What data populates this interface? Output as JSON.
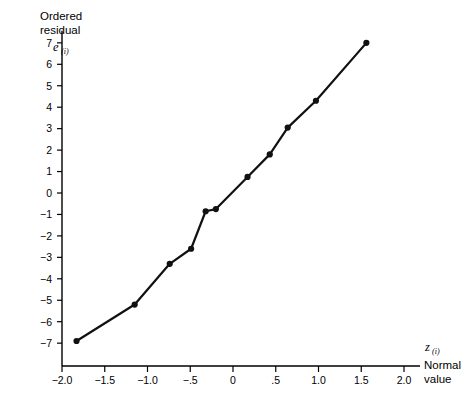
{
  "chart_data": {
    "type": "line",
    "title": "",
    "subtitle": "",
    "ylabel_line1": "Ordered",
    "ylabel_line2": "residual",
    "ylabel_symbol": "e",
    "ylabel_symbol_sub": "(i)",
    "xlabel_symbol": "z",
    "xlabel_symbol_sub": "(i)",
    "xlabel_line1": "Normal",
    "xlabel_line2": "value",
    "xlabel": "z(i) Normal value",
    "ylabel": "Ordered residual e(i)",
    "grid": false,
    "legend": null,
    "marker": "filled-circle",
    "line_color": "#111111",
    "marker_color": "#111111",
    "xlim": [
      -2.0,
      2.0
    ],
    "ylim": [
      -7.5,
      7.6
    ],
    "xticks": [
      -2.0,
      -1.5,
      -1.0,
      -0.5,
      0,
      0.5,
      1.0,
      1.5,
      2.0
    ],
    "xticklabels": [
      "−2.0",
      "−1.5",
      "−1.0",
      "−.5",
      "0",
      ".5",
      "1.0",
      "1.5",
      "2.0"
    ],
    "yticks": [
      -7,
      -6,
      -5,
      -4,
      -3,
      -2,
      -1,
      0,
      1,
      2,
      3,
      4,
      5,
      6,
      7
    ],
    "yticklabels": [
      "−7",
      "−6",
      "−5",
      "−4",
      "−3",
      "−2",
      "−1",
      "0",
      "1",
      "2",
      "3",
      "4",
      "5",
      "6",
      "7"
    ],
    "x": [
      -1.83,
      -1.15,
      -0.74,
      -0.49,
      -0.32,
      -0.2,
      0.17,
      0.43,
      0.64,
      0.97,
      1.56
    ],
    "y": [
      -6.9,
      -5.2,
      -3.3,
      -2.6,
      -0.85,
      -0.75,
      0.75,
      1.8,
      3.05,
      4.3,
      7.0
    ],
    "points": [
      {
        "x": -1.83,
        "y": -6.9
      },
      {
        "x": -1.15,
        "y": -5.2
      },
      {
        "x": -0.74,
        "y": -3.3
      },
      {
        "x": -0.49,
        "y": -2.6
      },
      {
        "x": -0.32,
        "y": -0.85
      },
      {
        "x": -0.2,
        "y": -0.75
      },
      {
        "x": 0.17,
        "y": 0.75
      },
      {
        "x": 0.43,
        "y": 1.8
      },
      {
        "x": 0.64,
        "y": 3.05
      },
      {
        "x": 0.97,
        "y": 4.3
      },
      {
        "x": 1.56,
        "y": 7.0
      }
    ]
  }
}
